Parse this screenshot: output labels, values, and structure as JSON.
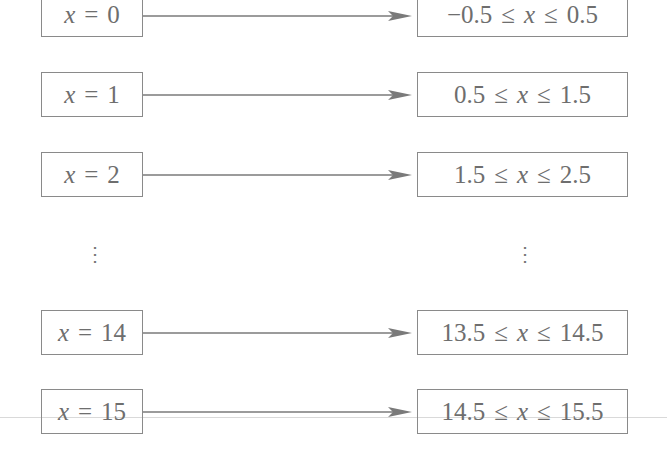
{
  "diagram": {
    "type": "mapping",
    "rows": [
      {
        "left": {
          "var": "x",
          "op": "=",
          "val": "0"
        },
        "right": {
          "lo": "−0.5",
          "var": "x",
          "hi": "0.5"
        }
      },
      {
        "left": {
          "var": "x",
          "op": "=",
          "val": "1"
        },
        "right": {
          "lo": "0.5",
          "var": "x",
          "hi": "1.5"
        }
      },
      {
        "left": {
          "var": "x",
          "op": "=",
          "val": "2"
        },
        "right": {
          "lo": "1.5",
          "var": "x",
          "hi": "2.5"
        }
      },
      {
        "left": {
          "var": "x",
          "op": "=",
          "val": "14"
        },
        "right": {
          "lo": "13.5",
          "var": "x",
          "hi": "14.5"
        }
      },
      {
        "left": {
          "var": "x",
          "op": "=",
          "val": "15"
        },
        "right": {
          "lo": "14.5",
          "var": "x",
          "hi": "15.5"
        }
      }
    ],
    "le_symbol": "≤",
    "ellipsis": "⋮",
    "colors": {
      "stroke": "#8a8a8a",
      "text": "#6e6e6e",
      "arrow": "#7a7a7a"
    }
  }
}
